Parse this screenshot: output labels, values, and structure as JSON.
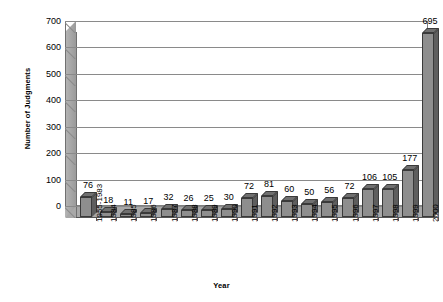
{
  "chart_data": {
    "type": "bar",
    "title": "",
    "xlabel": "Year",
    "ylabel": "Number of Judgments",
    "categories": [
      "1955-1983",
      "1984",
      "1985",
      "1986",
      "1987",
      "1988",
      "1989",
      "1990",
      "1991",
      "1992",
      "1993",
      "1994",
      "1995",
      "1996",
      "1997",
      "1998",
      "1999",
      "2000"
    ],
    "values": [
      76,
      18,
      11,
      17,
      32,
      26,
      25,
      30,
      72,
      81,
      60,
      50,
      56,
      72,
      106,
      105,
      177,
      695
    ],
    "data_labels": [
      "76",
      "18",
      "11",
      "17",
      "32",
      "26",
      "25",
      "30",
      "72",
      "81",
      "60",
      "50",
      "56",
      "72",
      "106",
      "105",
      "177",
      "695"
    ],
    "ylim": [
      0,
      700
    ],
    "ytick_values": [
      0,
      100,
      200,
      300,
      400,
      500,
      600,
      700
    ],
    "ytick_labels": [
      "0",
      "100",
      "200",
      "300",
      "400",
      "500",
      "600",
      "700"
    ],
    "grid": true,
    "grid_axis": "y",
    "legend": false,
    "legend_position": "none",
    "style": "excel-3d-column",
    "series": [
      {
        "name": "Number of Judgments",
        "values": [
          76,
          18,
          11,
          17,
          32,
          26,
          25,
          30,
          72,
          81,
          60,
          50,
          56,
          72,
          106,
          105,
          177,
          695
        ]
      }
    ],
    "colors": {
      "bar_face": "#8e8e8e",
      "bar_side": "#5e5e5e",
      "bar_top": "#707070",
      "bar_outline": "#3a3a3a",
      "plot_background": "#ffffff",
      "gridline": "#8a8a8a",
      "floor": "#a8a8a8",
      "wall_left": "#a8a8a8",
      "axis": "#707070",
      "text": "#000000"
    }
  },
  "axes": {
    "y_title": "Number of Judgments",
    "x_title": "Year"
  }
}
